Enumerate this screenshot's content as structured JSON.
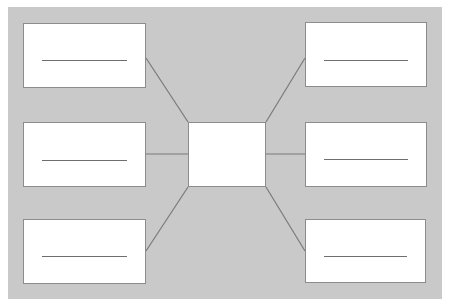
{
  "diagram": {
    "type": "spider-map",
    "background_color": "#c9c9c9",
    "box_border_color": "#8c8c8c",
    "line_color": "#6e6e6e",
    "center": {
      "label": "",
      "x": 188,
      "y": 122,
      "w": 78,
      "h": 65
    },
    "boxes": [
      {
        "id": "top-left",
        "label": "",
        "x": 23,
        "y": 23,
        "w": 123,
        "h": 65,
        "blank_y": 36,
        "anchor": [
          146,
          58
        ],
        "target": [
          188,
          122
        ]
      },
      {
        "id": "middle-left",
        "label": "",
        "x": 23,
        "y": 122,
        "w": 123,
        "h": 65,
        "blank_y": 37,
        "anchor": [
          146,
          154
        ],
        "target": [
          188,
          154
        ]
      },
      {
        "id": "bottom-left",
        "label": "",
        "x": 23,
        "y": 219,
        "w": 123,
        "h": 65,
        "blank_y": 36,
        "anchor": [
          146,
          251
        ],
        "target": [
          188,
          187
        ]
      },
      {
        "id": "top-right",
        "label": "",
        "x": 305,
        "y": 22,
        "w": 122,
        "h": 65,
        "blank_y": 37,
        "anchor": [
          305,
          58
        ],
        "target": [
          266,
          122
        ]
      },
      {
        "id": "middle-right",
        "label": "",
        "x": 305,
        "y": 122,
        "w": 122,
        "h": 65,
        "blank_y": 36,
        "anchor": [
          305,
          154
        ],
        "target": [
          266,
          154
        ]
      },
      {
        "id": "bottom-right",
        "label": "",
        "x": 305,
        "y": 219,
        "w": 121,
        "h": 64,
        "blank_y": 36,
        "anchor": [
          305,
          251
        ],
        "target": [
          266,
          187
        ]
      }
    ]
  }
}
